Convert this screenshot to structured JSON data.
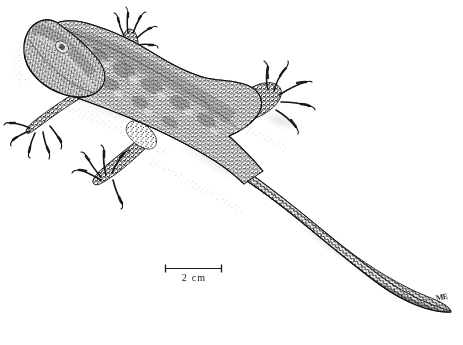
{
  "figure": {
    "illustration_style": "stipple-ink-drawing",
    "background_color": "#ffffff",
    "ink_color": "#1a1a1a",
    "width": 463,
    "height": 345
  },
  "scale_bar": {
    "label": "2 cm",
    "length_px": 58,
    "x": 165,
    "y": 268,
    "tick_height": 7,
    "color": "#1a1a1a"
  },
  "artist_signature": {
    "monogram": "ME",
    "x": 435,
    "y": 294
  },
  "anatomy": {
    "parts": [
      {
        "name": "head",
        "label": "head"
      },
      {
        "name": "body",
        "label": "trunk"
      },
      {
        "name": "tail",
        "label": "tail"
      },
      {
        "name": "forelimb-left",
        "label": "left forelimb"
      },
      {
        "name": "forelimb-right",
        "label": "right forelimb"
      },
      {
        "name": "hindlimb-left",
        "label": "left hindlimb"
      },
      {
        "name": "hindlimb-right",
        "label": "right hindlimb"
      }
    ]
  }
}
